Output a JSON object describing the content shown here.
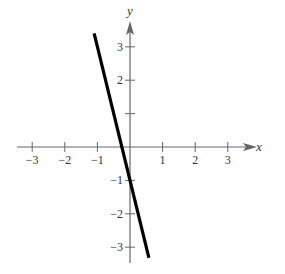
{
  "chart_data": {
    "type": "line",
    "title": "",
    "xlabel": "x",
    "ylabel": "y",
    "xlim": [
      -3.5,
      3.9
    ],
    "ylim": [
      -3.5,
      3.7
    ],
    "xticks": [
      -3,
      -2,
      -1,
      1,
      2,
      3
    ],
    "yticks": [
      -3,
      -2,
      -1,
      1,
      2,
      3
    ],
    "xtick_labels": [
      "−3",
      "−2",
      "−1",
      "1",
      "2",
      "3"
    ],
    "ytick_labels": [
      "−3",
      "−2",
      "−1",
      "",
      "2",
      "3"
    ],
    "grid": false,
    "legend": null,
    "series": [
      {
        "name": "y = -4x - 1",
        "equation": "y = -4x - 1",
        "x": [
          -1.1,
          0.58
        ],
        "y": [
          3.4,
          -3.32
        ],
        "color": "#000000"
      }
    ]
  },
  "axes": {
    "x_label": "x",
    "y_label": "y"
  }
}
